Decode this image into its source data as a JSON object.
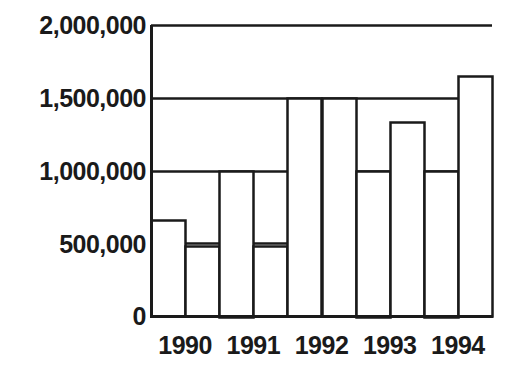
{
  "chart_data": {
    "type": "bar",
    "title": "",
    "subtitle": "",
    "xlabel": "",
    "ylabel": "",
    "categories": [
      "1990",
      "1991",
      "1992",
      "1993",
      "1994"
    ],
    "ytick_labels": [
      "2,000,000",
      "1,500,000",
      "1,000,000",
      "500,000",
      "0"
    ],
    "ytick_values": [
      2000000,
      1500000,
      1000000,
      500000,
      0
    ],
    "ylim": [
      0,
      2000000
    ],
    "grid": true,
    "legend": "none",
    "bars_per_category": 2,
    "series": [
      {
        "name": "Series 1",
        "values": [
          660000,
          1000000,
          1500000,
          1000000,
          1000000
        ]
      },
      {
        "name": "Series 2",
        "values": [
          480000,
          480000,
          1500000,
          1330000,
          1650000
        ]
      }
    ],
    "bar_fill": "#ffffff",
    "bar_stroke": "#1a1a1a",
    "axis_color": "#1a1a1a",
    "background": "#ffffff"
  }
}
